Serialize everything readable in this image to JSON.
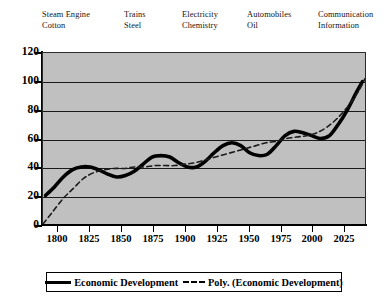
{
  "chart_data": {
    "type": "line",
    "title": "",
    "subtitle": "",
    "xlabel": "",
    "ylabel": "",
    "xlim": [
      1788,
      2042
    ],
    "ylim": [
      0,
      120
    ],
    "grid": true,
    "legend_position": "bottom",
    "x_ticks": [
      "1800",
      "1825",
      "1850",
      "1875",
      "1900",
      "1925",
      "1950",
      "1975",
      "2000",
      "2025"
    ],
    "x_tick_values": [
      1800,
      1825,
      1850,
      1875,
      1900,
      1925,
      1950,
      1975,
      2000,
      2025
    ],
    "y_ticks": [
      "0",
      "20",
      "40",
      "60",
      "80",
      "100",
      "120"
    ],
    "y_tick_values": [
      0,
      20,
      40,
      60,
      80,
      100,
      120
    ],
    "series": [
      {
        "name": "Economic Development",
        "style": "solid",
        "color": "#000000",
        "x": [
          1790,
          1797,
          1804,
          1811,
          1818,
          1825,
          1832,
          1839,
          1846,
          1853,
          1860,
          1867,
          1874,
          1881,
          1888,
          1895,
          1902,
          1909,
          1916,
          1923,
          1930,
          1937,
          1944,
          1951,
          1958,
          1965,
          1972,
          1979,
          1986,
          1993,
          2000,
          2007,
          2014,
          2021,
          2028,
          2035,
          2040
        ],
        "y": [
          20,
          26,
          33,
          38,
          40,
          40,
          38,
          35,
          33,
          34,
          37,
          42,
          47,
          48,
          47,
          43,
          40,
          40,
          44,
          50,
          55,
          57,
          55,
          50,
          48,
          49,
          55,
          62,
          65,
          64,
          62,
          60,
          62,
          70,
          80,
          92,
          100
        ]
      },
      {
        "name": "Poly. (Economic Development)",
        "style": "dashed",
        "color": "#1a1a1a",
        "x": [
          1788,
          1796,
          1804,
          1812,
          1820,
          1828,
          1836,
          1844,
          1852,
          1860,
          1868,
          1876,
          1884,
          1892,
          1900,
          1908,
          1916,
          1924,
          1932,
          1940,
          1948,
          1956,
          1964,
          1972,
          1980,
          1988,
          1996,
          2004,
          2012,
          2020,
          2028,
          2036,
          2042
        ],
        "y": [
          0,
          9,
          18,
          25,
          32,
          36,
          38,
          39,
          39,
          40,
          40,
          41,
          41,
          41,
          42,
          43,
          45,
          47,
          49,
          51,
          53,
          55,
          57,
          58,
          60,
          61,
          62,
          64,
          68,
          74,
          82,
          92,
          102
        ]
      }
    ]
  },
  "eras": [
    {
      "line1": "Steam Engine",
      "line2": "Cotton"
    },
    {
      "line1": "Trains",
      "line2": "Steel"
    },
    {
      "line1": "Electricity",
      "line2": "Chemistry"
    },
    {
      "line1": "Automobiles",
      "line2": "Oil"
    },
    {
      "line1": "Communication",
      "line2": "Information"
    }
  ],
  "legend": {
    "items": [
      {
        "label": "Economic Development",
        "style": "solid"
      },
      {
        "label": "Poly. (Economic Development)",
        "style": "dashed"
      }
    ]
  },
  "colors": {
    "plot_background": "#c0c0c0",
    "page_background": "#ffffff",
    "axis": "#000000",
    "gridline": "#1a1a1a",
    "series_line": "#000000",
    "trendline": "#1a1a1a"
  }
}
